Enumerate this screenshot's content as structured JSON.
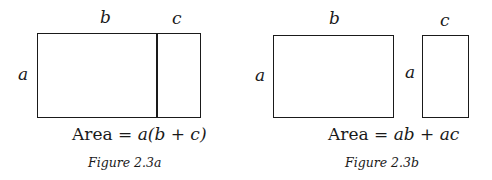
{
  "figure_a": {
    "label_top_left": "b",
    "label_top_right": "c",
    "label_side": "a",
    "area_prefix": "Area = ",
    "area_expr_a": "a",
    "area_expr_rest": "(b + c)",
    "caption": "Figure 2.3a"
  },
  "figure_b": {
    "label_top_left": "b",
    "label_top_right": "c",
    "label_side_left": "a",
    "label_side_right": "a",
    "area_prefix": "Area = ",
    "area_expr": "ab + ac",
    "caption": "Figure 2.3b"
  }
}
